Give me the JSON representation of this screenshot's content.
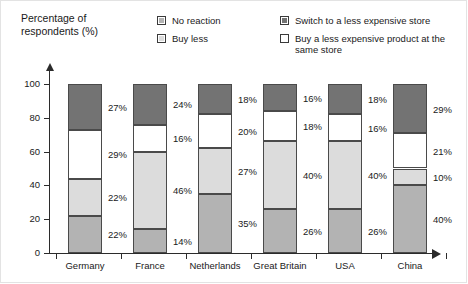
{
  "axis_title": "Percentage of\nrespondents (%)",
  "legend": {
    "left": [
      {
        "label": "No reaction",
        "swatch": "medium-gray",
        "color": "#b3b3b3"
      },
      {
        "label": "Buy less",
        "swatch": "light-gray",
        "color": "#dcdcdc"
      }
    ],
    "right": [
      {
        "label": "Switch to a less expensive store",
        "swatch": "dark-gray",
        "color": "#737373"
      },
      {
        "label": "Buy a less expensive product at the same store",
        "swatch": "white",
        "color": "#ffffff"
      }
    ]
  },
  "chart_data": {
    "type": "bar",
    "subtype": "stacked-bar-100",
    "title": "",
    "xlabel": "",
    "ylabel": "Percentage of respondents (%)",
    "ylim": [
      0,
      100
    ],
    "yticks": [
      0,
      20,
      40,
      60,
      80,
      100
    ],
    "ytick_labels": [
      "0",
      "20",
      "40",
      "60",
      "80",
      "100"
    ],
    "grid": false,
    "legend_position": "top-right",
    "categories": [
      "Germany",
      "France",
      "Netherlands",
      "Great Britain",
      "USA",
      "China"
    ],
    "series": [
      {
        "name": "No reaction",
        "color": "#b3b3b3",
        "values": [
          22,
          14,
          35,
          26,
          26,
          40
        ],
        "labels": [
          "22%",
          "14%",
          "35%",
          "26%",
          "26%",
          "40%"
        ]
      },
      {
        "name": "Buy less",
        "color": "#dcdcdc",
        "values": [
          22,
          46,
          27,
          40,
          40,
          10
        ],
        "labels": [
          "22%",
          "46%",
          "27%",
          "40%",
          "40%",
          "10%"
        ]
      },
      {
        "name": "Buy a less expensive product at the same store",
        "color": "#ffffff",
        "values": [
          29,
          16,
          20,
          18,
          16,
          21
        ],
        "labels": [
          "29%",
          "16%",
          "20%",
          "18%",
          "16%",
          "21%"
        ]
      },
      {
        "name": "Switch to a less expensive store",
        "color": "#737373",
        "values": [
          27,
          24,
          18,
          16,
          18,
          29
        ],
        "labels": [
          "27%",
          "24%",
          "18%",
          "16%",
          "18%",
          "29%"
        ]
      }
    ]
  }
}
